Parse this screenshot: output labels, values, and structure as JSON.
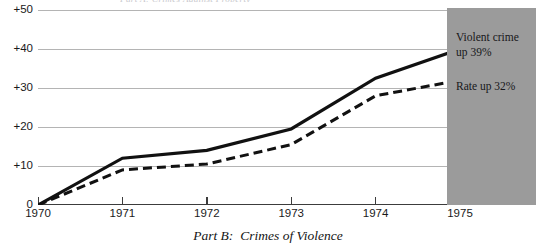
{
  "caption": {
    "label": "Part B:",
    "text": "Crimes of Violence"
  },
  "title_fragment": "Part A:  Crimes Against Property",
  "callouts": [
    {
      "line1": "Violent crime",
      "line2": "up 39%"
    },
    {
      "line1": "Rate up 32%",
      "line2": ""
    }
  ],
  "colors": {
    "plot_background": "#ffffff",
    "gridline": "#b4b4b4",
    "axis": "#3c3c3c",
    "series_solid": "#111111",
    "series_dashed": "#111111",
    "callout_panel": "#9b9b9b",
    "text": "#1a1a1a"
  },
  "chart_data": {
    "type": "line",
    "xlabel": "",
    "ylabel": "",
    "x": [
      1970,
      1971,
      1972,
      1973,
      1974,
      1975
    ],
    "xtick_labels": [
      "1970",
      "1971",
      "1972",
      "1973",
      "1974",
      "1975"
    ],
    "ytick_labels": [
      "0",
      "+10",
      "+20",
      "+30",
      "+40",
      "+50"
    ],
    "ytick_values": [
      0,
      10,
      20,
      30,
      40,
      50
    ],
    "ylim": [
      0,
      50
    ],
    "xlim": [
      1970,
      1975
    ],
    "grid": true,
    "grid_axis": "y",
    "legend_position": "right-annotation",
    "series": [
      {
        "name": "Violent crime",
        "style": "solid",
        "end_label": "Violent crime up 39%",
        "values": [
          0,
          12,
          14,
          19.5,
          32.5,
          40
        ]
      },
      {
        "name": "Rate",
        "style": "dashed",
        "end_label": "Rate up 32%",
        "values": [
          0,
          9,
          10.5,
          15.5,
          28,
          32
        ]
      }
    ]
  }
}
